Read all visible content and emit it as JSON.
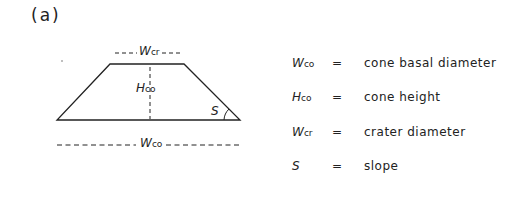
{
  "panel_label": "(a)",
  "diagram": {
    "labels": {
      "crater_width": {
        "main": "W",
        "sub": "cr"
      },
      "cone_height": {
        "main": "H",
        "sub": "co"
      },
      "slope": {
        "main": "S"
      },
      "basal_width": {
        "main": "W",
        "sub": "co"
      }
    }
  },
  "legend": [
    {
      "symbol": "W",
      "sub": "co",
      "eq": "=",
      "desc": "cone basal diameter"
    },
    {
      "symbol": "H",
      "sub": "co",
      "eq": "=",
      "desc": "cone height"
    },
    {
      "symbol": "W",
      "sub": "cr",
      "eq": "=",
      "desc": "crater diameter"
    },
    {
      "symbol": "S",
      "sub": "",
      "eq": "=",
      "desc": "slope"
    }
  ]
}
